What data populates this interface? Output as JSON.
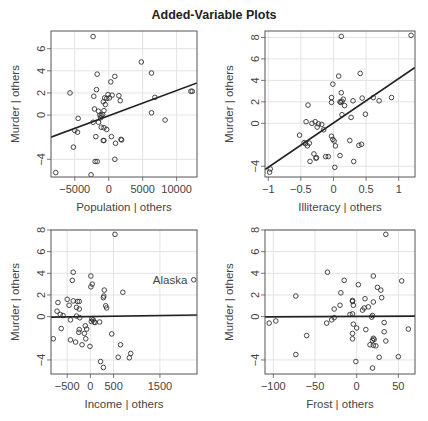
{
  "title": "Added-Variable Plots",
  "chart_data": [
    {
      "type": "scatter",
      "title": "",
      "xlabel": "Population | others",
      "ylabel": "Murder | others",
      "xticks": [
        -5000,
        0,
        5000,
        10000
      ],
      "yticks": [
        -4,
        0,
        2,
        4,
        6
      ],
      "xlim": [
        -8500,
        13000
      ],
      "ylim": [
        -5.6,
        7.6
      ],
      "grid": true,
      "fit_line": {
        "x0": -8500,
        "y0": -2.0,
        "x1": 13000,
        "y1": 2.9
      },
      "points": [
        [
          -2300,
          7.1
        ],
        [
          4800,
          4.8
        ],
        [
          6300,
          3.8
        ],
        [
          -1700,
          3.7
        ],
        [
          900,
          3.5
        ],
        [
          300,
          3.0
        ],
        [
          -1800,
          2.3
        ],
        [
          -5700,
          2.0
        ],
        [
          -100,
          1.85
        ],
        [
          500,
          1.8
        ],
        [
          -2200,
          1.7
        ],
        [
          -600,
          1.55
        ],
        [
          -300,
          1.5
        ],
        [
          100,
          1.55
        ],
        [
          1500,
          1.75
        ],
        [
          1700,
          1.3
        ],
        [
          -800,
          1.2
        ],
        [
          -500,
          0.95
        ],
        [
          6800,
          1.6
        ],
        [
          12100,
          2.15
        ],
        [
          12300,
          2.15
        ],
        [
          -2100,
          0.55
        ],
        [
          -1500,
          0.35
        ],
        [
          -700,
          0.4
        ],
        [
          -1300,
          0.0
        ],
        [
          -1100,
          -0.05
        ],
        [
          -900,
          0.05
        ],
        [
          6300,
          0.2
        ],
        [
          -4500,
          -0.3
        ],
        [
          -1200,
          -0.25
        ],
        [
          -2300,
          -0.65
        ],
        [
          -1500,
          -0.65
        ],
        [
          -1100,
          -1.1
        ],
        [
          -700,
          -1.15
        ],
        [
          -300,
          -1.3
        ],
        [
          -5000,
          -1.4
        ],
        [
          -4600,
          -1.55
        ],
        [
          8300,
          -0.45
        ],
        [
          -1900,
          -1.95
        ],
        [
          400,
          -1.95
        ],
        [
          -800,
          -2.3
        ],
        [
          -700,
          -2.3
        ],
        [
          1800,
          -2.2
        ],
        [
          1900,
          -2.25
        ],
        [
          1000,
          -2.55
        ],
        [
          -5200,
          -2.9
        ],
        [
          -2000,
          -4.2
        ],
        [
          -1700,
          -4.2
        ],
        [
          900,
          -4.0
        ],
        [
          -7800,
          -5.2
        ],
        [
          -2600,
          -5.4
        ]
      ]
    },
    {
      "type": "scatter",
      "title": "",
      "xlabel": "Illiteracy | others",
      "ylabel": "Murder | others",
      "xticks": [
        -1.0,
        -0.5,
        0.0,
        0.5,
        1.0
      ],
      "yticks": [
        -4,
        0,
        2,
        4,
        6,
        8
      ],
      "xlim": [
        -1.05,
        1.25
      ],
      "ylim": [
        -5.0,
        8.6
      ],
      "grid": true,
      "fit_line": {
        "x0": -1.05,
        "y0": -4.3,
        "x1": 1.25,
        "y1": 5.2
      },
      "points": [
        [
          0.12,
          8.1
        ],
        [
          1.19,
          8.2
        ],
        [
          0.41,
          4.65
        ],
        [
          0.08,
          4.4
        ],
        [
          -0.01,
          3.65
        ],
        [
          0.12,
          2.85
        ],
        [
          0.89,
          2.4
        ],
        [
          0.61,
          2.4
        ],
        [
          0.44,
          2.35
        ],
        [
          -0.03,
          2.4
        ],
        [
          0.15,
          2.25
        ],
        [
          0.7,
          2.1
        ],
        [
          0.3,
          2.1
        ],
        [
          0.1,
          2.0
        ],
        [
          0.11,
          1.95
        ],
        [
          -0.03,
          1.95
        ],
        [
          0.13,
          2.05
        ],
        [
          0.17,
          1.65
        ],
        [
          -0.39,
          1.7
        ],
        [
          0.49,
          0.85
        ],
        [
          0.13,
          0.8
        ],
        [
          0.27,
          0.55
        ],
        [
          -0.42,
          0.15
        ],
        [
          -0.28,
          0.15
        ],
        [
          -0.33,
          0.0
        ],
        [
          -0.23,
          -0.05
        ],
        [
          -0.18,
          -0.1
        ],
        [
          -0.25,
          -0.35
        ],
        [
          -0.15,
          -0.6
        ],
        [
          -0.52,
          -1.1
        ],
        [
          -0.03,
          -1.2
        ],
        [
          -0.01,
          -1.5
        ],
        [
          0.01,
          -1.65
        ],
        [
          -0.45,
          -1.8
        ],
        [
          -0.43,
          -1.9
        ],
        [
          -0.37,
          -1.85
        ],
        [
          0.25,
          -1.6
        ],
        [
          -0.4,
          -2.1
        ],
        [
          0.03,
          -2.1
        ],
        [
          0.39,
          -2.05
        ],
        [
          0.43,
          -1.95
        ],
        [
          -0.3,
          -2.85
        ],
        [
          -0.27,
          -3.25
        ],
        [
          -0.26,
          -3.2
        ],
        [
          -0.12,
          -3.1
        ],
        [
          -0.08,
          -3.1
        ],
        [
          0.1,
          -3.0
        ],
        [
          -0.36,
          -3.55
        ],
        [
          0.31,
          -3.55
        ],
        [
          0.02,
          -4.1
        ],
        [
          -0.97,
          -4.25
        ],
        [
          -0.98,
          -4.55
        ]
      ]
    },
    {
      "type": "scatter",
      "title": "",
      "xlabel": "Income | others",
      "ylabel": "Murder | others",
      "xticks": [
        -500,
        0,
        500,
        1500
      ],
      "yticks": [
        -4,
        0,
        2,
        4,
        6,
        8
      ],
      "xlim": [
        -850,
        2300
      ],
      "ylim": [
        -5.3,
        8.0
      ],
      "grid": true,
      "fit_line": {
        "x0": -850,
        "y0": -0.05,
        "x1": 2300,
        "y1": 0.15
      },
      "annotation": {
        "text": "Alaska",
        "x": 2200,
        "y": 3.4
      },
      "points": [
        [
          530,
          7.6
        ],
        [
          -370,
          4.1
        ],
        [
          10,
          3.75
        ],
        [
          -390,
          3.35
        ],
        [
          40,
          3.0
        ],
        [
          10,
          2.75
        ],
        [
          300,
          2.45
        ],
        [
          700,
          2.25
        ],
        [
          290,
          1.9
        ],
        [
          280,
          1.75
        ],
        [
          -500,
          1.6
        ],
        [
          -700,
          1.3
        ],
        [
          -370,
          1.45
        ],
        [
          -240,
          1.4
        ],
        [
          -280,
          1.4
        ],
        [
          -460,
          1.05
        ],
        [
          -300,
          0.85
        ],
        [
          -240,
          0.7
        ],
        [
          330,
          1.0
        ],
        [
          350,
          0.8
        ],
        [
          -720,
          0.5
        ],
        [
          -650,
          0.2
        ],
        [
          -590,
          0.1
        ],
        [
          -300,
          0.05
        ],
        [
          -230,
          -0.1
        ],
        [
          -430,
          -0.3
        ],
        [
          30,
          -0.2
        ],
        [
          60,
          -0.3
        ],
        [
          20,
          -0.45
        ],
        [
          80,
          -0.5
        ],
        [
          100,
          -0.55
        ],
        [
          200,
          -0.5
        ],
        [
          -110,
          -0.85
        ],
        [
          -80,
          -1.15
        ],
        [
          -240,
          -1.2
        ],
        [
          -250,
          -1.45
        ],
        [
          -130,
          -1.55
        ],
        [
          -630,
          -1.1
        ],
        [
          460,
          -1.6
        ],
        [
          -100,
          -2.05
        ],
        [
          -800,
          -2.05
        ],
        [
          -430,
          -2.15
        ],
        [
          -320,
          -2.35
        ],
        [
          -180,
          -2.6
        ],
        [
          -10,
          -2.75
        ],
        [
          650,
          -2.6
        ],
        [
          870,
          -3.4
        ],
        [
          840,
          -3.8
        ],
        [
          600,
          -3.75
        ],
        [
          220,
          -4.15
        ],
        [
          280,
          -4.7
        ],
        [
          2230,
          3.4
        ]
      ]
    },
    {
      "type": "scatter",
      "title": "",
      "xlabel": "Frost | others",
      "ylabel": "Murder | others",
      "xticks": [
        -100,
        -50,
        0,
        50
      ],
      "yticks": [
        -4,
        0,
        2,
        4,
        6,
        8
      ],
      "xlim": [
        -110,
        70
      ],
      "ylim": [
        -5.3,
        8.0
      ],
      "grid": true,
      "fit_line": {
        "x0": -110,
        "y0": -0.02,
        "x1": 70,
        "y1": 0.05
      },
      "points": [
        [
          35,
          7.6
        ],
        [
          -35,
          4.1
        ],
        [
          20,
          3.75
        ],
        [
          54,
          3.3
        ],
        [
          -15,
          3.35
        ],
        [
          2,
          2.95
        ],
        [
          25,
          2.7
        ],
        [
          29,
          2.45
        ],
        [
          -19,
          2.2
        ],
        [
          -73,
          1.9
        ],
        [
          30,
          1.75
        ],
        [
          10,
          1.65
        ],
        [
          -5,
          1.5
        ],
        [
          -5,
          1.4
        ],
        [
          20,
          1.35
        ],
        [
          -4,
          1.05
        ],
        [
          -20,
          1.05
        ],
        [
          14,
          0.9
        ],
        [
          9,
          0.8
        ],
        [
          7,
          0.6
        ],
        [
          -27,
          0.7
        ],
        [
          -5,
          0.25
        ],
        [
          -8,
          0.2
        ],
        [
          19,
          0.1
        ],
        [
          18,
          -0.05
        ],
        [
          -27,
          -0.1
        ],
        [
          -30,
          -0.3
        ],
        [
          -105,
          -0.6
        ],
        [
          -97,
          -0.4
        ],
        [
          -36,
          -0.6
        ],
        [
          -4,
          -0.7
        ],
        [
          33,
          -0.55
        ],
        [
          0,
          -1.05
        ],
        [
          11,
          -1.2
        ],
        [
          62,
          -1.15
        ],
        [
          33,
          -1.4
        ],
        [
          -5,
          -1.55
        ],
        [
          -60,
          -1.75
        ],
        [
          -5,
          -2.05
        ],
        [
          20,
          -2.0
        ],
        [
          21,
          -2.1
        ],
        [
          19,
          -2.2
        ],
        [
          35,
          -2.25
        ],
        [
          16,
          -2.6
        ],
        [
          20,
          -2.65
        ],
        [
          23,
          -2.7
        ],
        [
          27,
          -3.75
        ],
        [
          50,
          -3.7
        ],
        [
          -73,
          -3.5
        ],
        [
          -1,
          -4.15
        ],
        [
          19,
          -4.75
        ]
      ]
    }
  ]
}
